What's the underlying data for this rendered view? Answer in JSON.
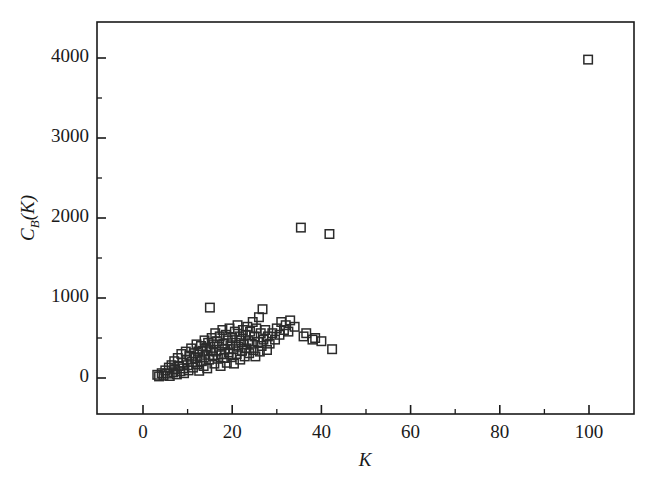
{
  "figure": {
    "background_color": "#ffffff",
    "marker_color": "#2b2b2b",
    "axis_color": "#1a1a1a"
  },
  "chart_data": {
    "type": "scatter",
    "title": "",
    "subtitle": "",
    "xlabel": "K",
    "ylabel": "C_B(K)",
    "ylabel_base": "C",
    "ylabel_sub": "B",
    "ylabel_arg": "(K)",
    "xlim": [
      -10,
      110
    ],
    "ylim": [
      -300,
      4400
    ],
    "grid": false,
    "legend": null,
    "marker_style": "open-square",
    "xticks": [
      0,
      20,
      40,
      60,
      80,
      100
    ],
    "xtick_labels": [
      "0",
      "20",
      "40",
      "60",
      "80",
      "100"
    ],
    "xminor_ticks": [
      10,
      30,
      50,
      70,
      90
    ],
    "yticks": [
      0,
      1000,
      2000,
      3000,
      4000
    ],
    "ytick_labels": [
      "0",
      "1000",
      "2000",
      "3000",
      "4000"
    ],
    "yminor_ticks": [
      500,
      1500,
      2500,
      3500
    ],
    "points": [
      [
        3.2,
        40
      ],
      [
        3.6,
        20
      ],
      [
        4.2,
        60
      ],
      [
        4.6,
        30
      ],
      [
        5.0,
        95
      ],
      [
        5.4,
        55
      ],
      [
        5.8,
        130
      ],
      [
        6.0,
        25
      ],
      [
        6.4,
        160
      ],
      [
        6.8,
        70
      ],
      [
        7.0,
        210
      ],
      [
        7.2,
        110
      ],
      [
        7.6,
        45
      ],
      [
        7.8,
        250
      ],
      [
        8.0,
        150
      ],
      [
        8.4,
        85
      ],
      [
        8.6,
        300
      ],
      [
        8.8,
        190
      ],
      [
        9.0,
        120
      ],
      [
        9.2,
        60
      ],
      [
        9.6,
        330
      ],
      [
        9.8,
        230
      ],
      [
        10.0,
        160
      ],
      [
        10.2,
        95
      ],
      [
        10.4,
        280
      ],
      [
        10.8,
        370
      ],
      [
        11.0,
        200
      ],
      [
        11.2,
        130
      ],
      [
        11.4,
        310
      ],
      [
        11.8,
        250
      ],
      [
        12.0,
        420
      ],
      [
        12.2,
        170
      ],
      [
        12.4,
        330
      ],
      [
        12.6,
        90
      ],
      [
        12.8,
        260
      ],
      [
        13.0,
        400
      ],
      [
        13.2,
        210
      ],
      [
        13.4,
        340
      ],
      [
        13.6,
        150
      ],
      [
        13.8,
        470
      ],
      [
        14.0,
        290
      ],
      [
        14.2,
        380
      ],
      [
        14.4,
        120
      ],
      [
        14.6,
        440
      ],
      [
        14.8,
        230
      ],
      [
        15.0,
        880
      ],
      [
        15.2,
        350
      ],
      [
        15.4,
        500
      ],
      [
        15.6,
        270
      ],
      [
        15.8,
        420
      ],
      [
        16.0,
        180
      ],
      [
        16.2,
        560
      ],
      [
        16.4,
        330
      ],
      [
        16.6,
        460
      ],
      [
        16.8,
        240
      ],
      [
        17.0,
        390
      ],
      [
        17.2,
        520
      ],
      [
        17.4,
        150
      ],
      [
        17.6,
        300
      ],
      [
        17.8,
        600
      ],
      [
        18.0,
        430
      ],
      [
        18.2,
        250
      ],
      [
        18.4,
        360
      ],
      [
        18.6,
        540
      ],
      [
        18.8,
        190
      ],
      [
        19.0,
        470
      ],
      [
        19.2,
        320
      ],
      [
        19.4,
        620
      ],
      [
        19.6,
        410
      ],
      [
        19.8,
        260
      ],
      [
        20.0,
        500
      ],
      [
        20.2,
        360
      ],
      [
        20.4,
        180
      ],
      [
        20.6,
        580
      ],
      [
        20.8,
        440
      ],
      [
        21.0,
        300
      ],
      [
        21.2,
        660
      ],
      [
        21.4,
        390
      ],
      [
        21.6,
        520
      ],
      [
        21.8,
        230
      ],
      [
        22.0,
        470
      ],
      [
        22.2,
        340
      ],
      [
        22.4,
        600
      ],
      [
        22.6,
        420
      ],
      [
        22.8,
        270
      ],
      [
        23.0,
        540
      ],
      [
        23.2,
        370
      ],
      [
        23.4,
        640
      ],
      [
        23.6,
        460
      ],
      [
        23.8,
        310
      ],
      [
        24.0,
        580
      ],
      [
        24.4,
        430
      ],
      [
        24.6,
        700
      ],
      [
        24.8,
        350
      ],
      [
        25.0,
        520
      ],
      [
        25.2,
        270
      ],
      [
        25.4,
        620
      ],
      [
        25.8,
        450
      ],
      [
        26.0,
        760
      ],
      [
        26.2,
        330
      ],
      [
        26.4,
        560
      ],
      [
        26.6,
        400
      ],
      [
        26.8,
        860
      ],
      [
        27.0,
        480
      ],
      [
        27.4,
        600
      ],
      [
        27.8,
        350
      ],
      [
        28.0,
        520
      ],
      [
        28.4,
        430
      ],
      [
        29.0,
        560
      ],
      [
        29.6,
        480
      ],
      [
        30.0,
        620
      ],
      [
        30.6,
        540
      ],
      [
        31.0,
        700
      ],
      [
        31.6,
        600
      ],
      [
        32.0,
        660
      ],
      [
        32.6,
        580
      ],
      [
        33.0,
        720
      ],
      [
        34.0,
        640
      ],
      [
        35.4,
        1880
      ],
      [
        36.0,
        520
      ],
      [
        36.6,
        560
      ],
      [
        38.0,
        480
      ],
      [
        38.6,
        500
      ],
      [
        40.0,
        460
      ],
      [
        41.8,
        1800
      ],
      [
        42.4,
        360
      ],
      [
        99.8,
        3980
      ]
    ]
  }
}
